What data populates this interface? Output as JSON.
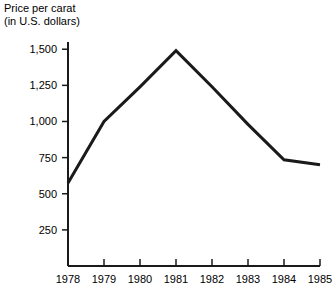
{
  "chart_data": {
    "type": "line",
    "title": "Price per carat",
    "subtitle": "(in U.S. dollars)",
    "title_lines": [
      "Price per carat",
      "(in U.S. dollars)"
    ],
    "xlabel": "",
    "ylabel": "",
    "x": [
      "1978",
      "1979",
      "1980",
      "1981",
      "1982",
      "1983",
      "1984",
      "1985"
    ],
    "categories": [
      "1978",
      "1979",
      "1980",
      "1981",
      "1982",
      "1983",
      "1984",
      "1985"
    ],
    "values": [
      575,
      1000,
      1240,
      1490,
      1240,
      980,
      735,
      700
    ],
    "series": [
      {
        "name": "Price per carat",
        "values": [
          575,
          1000,
          1240,
          1490,
          1240,
          980,
          735,
          700
        ],
        "color": "#1a1a1a",
        "line_width": 3
      }
    ],
    "xlim": [
      "1978",
      "1985"
    ],
    "ylim": [
      0,
      1550
    ],
    "ytick_values": [
      250,
      500,
      750,
      1000,
      1250,
      1500
    ],
    "ytick_labels": [
      "250",
      "500",
      "750",
      "1,000",
      "1,250",
      "1,500"
    ],
    "xtick_labels": [
      "1978",
      "1979",
      "1980",
      "1981",
      "1982",
      "1983",
      "1984",
      "1985"
    ],
    "grid": false,
    "legend": false,
    "legend_position": "none",
    "background_color": "#ffffff",
    "axis_color": "#1a1a1a"
  },
  "axis": {
    "y_axis_name": "y-axis",
    "x_axis_name": "x-axis"
  }
}
